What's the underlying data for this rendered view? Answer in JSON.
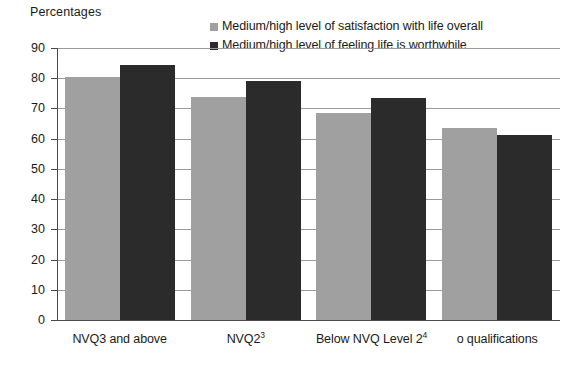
{
  "chart_data": {
    "type": "bar",
    "title": "",
    "subtitle": "",
    "xlabel": "",
    "ylabel": "Percentages",
    "ylim": [
      0,
      90
    ],
    "ytick_labels": [
      "90",
      "80",
      "70",
      "60",
      "50",
      "40",
      "30",
      "20",
      "10",
      "0"
    ],
    "ytick_values": [
      90,
      80,
      70,
      60,
      50,
      40,
      30,
      20,
      10,
      0
    ],
    "grid": true,
    "legend_position": "top-right",
    "categories": [
      "NVQ3 and above",
      "NVQ2",
      "Below NVQ Level 2",
      "o qualifications"
    ],
    "category_superscripts": [
      "",
      "3",
      "4",
      ""
    ],
    "series": [
      {
        "name": "Medium/high level of satisfaction with life overall",
        "color": "#a0a0a0",
        "values": [
          80.5,
          73.8,
          68.5,
          63.5
        ]
      },
      {
        "name": "Medium/high level of feeling life is worthwhile",
        "color": "#2b2b2b",
        "values": [
          84.5,
          79.0,
          73.5,
          61.3
        ]
      }
    ]
  },
  "legend": {
    "items": [
      {
        "label": "Medium/high level of satisfaction with life overall",
        "color": "#a0a0a0"
      },
      {
        "label": "Medium/high level of feeling life is worthwhile",
        "color": "#2b2b2b"
      }
    ]
  },
  "axis": {
    "y_title": "Percentages"
  },
  "colors": {
    "series_light": "#a0a0a0",
    "series_dark": "#2b2b2b",
    "gridline": "#9a9a9a",
    "axis": "#4a4a4a",
    "text": "#1a1a1a",
    "background": "#ffffff"
  }
}
